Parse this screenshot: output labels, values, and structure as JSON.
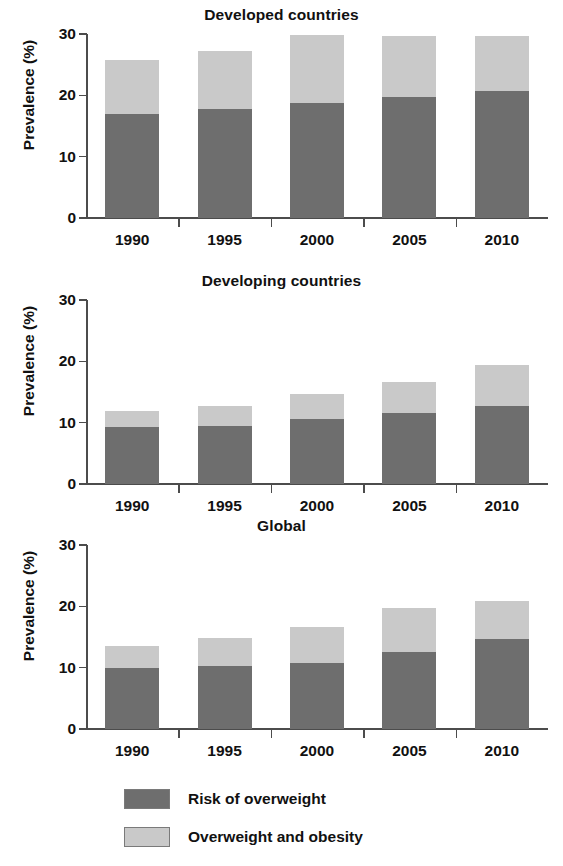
{
  "chart_data": {
    "type": "bar",
    "subtype": "stacked-bar",
    "title": "",
    "panels": [
      {
        "title": "Developed countries",
        "xlabel": "",
        "ylabel": "Prevalence (%)",
        "categories": [
          "1990",
          "1995",
          "2000",
          "2005",
          "2010"
        ],
        "ylim": [
          0,
          30
        ],
        "yticks": [
          0,
          10,
          20,
          30
        ],
        "ytick_labels": [
          "0",
          "10",
          "20",
          "30"
        ],
        "grid": false,
        "series": [
          {
            "name": "Risk of overweight",
            "values": [
              17.0,
              17.7,
              18.8,
              19.8,
              20.7
            ]
          },
          {
            "name": "Overweight and obesity",
            "values": [
              8.8,
              9.5,
              11.1,
              9.9,
              9.0
            ]
          }
        ],
        "totals": [
          25.8,
          27.2,
          29.9,
          29.7,
          29.7
        ]
      },
      {
        "title": "Developing countries",
        "xlabel": "",
        "ylabel": "Prevalence (%)",
        "categories": [
          "1990",
          "1995",
          "2000",
          "2005",
          "2010"
        ],
        "ylim": [
          0,
          30
        ],
        "yticks": [
          0,
          10,
          20,
          30
        ],
        "ytick_labels": [
          "0",
          "10",
          "20",
          "30"
        ],
        "grid": false,
        "series": [
          {
            "name": "Risk of overweight",
            "values": [
              9.3,
              9.5,
              10.6,
              11.6,
              12.7
            ]
          },
          {
            "name": "Overweight and obesity",
            "values": [
              2.6,
              3.2,
              4.0,
              5.1,
              6.7
            ]
          }
        ],
        "totals": [
          11.9,
          12.7,
          14.6,
          16.7,
          19.4
        ]
      },
      {
        "title": "Global",
        "xlabel": "",
        "ylabel": "Prevalence (%)",
        "categories": [
          "1990",
          "1995",
          "2000",
          "2005",
          "2010"
        ],
        "ylim": [
          0,
          30
        ],
        "yticks": [
          0,
          10,
          20,
          30
        ],
        "ytick_labels": [
          "0",
          "10",
          "20",
          "30"
        ],
        "grid": false,
        "series": [
          {
            "name": "Risk of overweight",
            "values": [
              9.9,
              10.2,
              10.8,
              12.6,
              14.7
            ]
          },
          {
            "name": "Overweight and obesity",
            "values": [
              3.7,
              4.7,
              5.9,
              7.2,
              6.1
            ]
          }
        ],
        "totals": [
          13.6,
          14.9,
          16.7,
          19.8,
          20.8
        ]
      }
    ],
    "legend": {
      "position": "bottom",
      "entries": [
        {
          "label": "Risk of overweight",
          "color": "#6e6e6e"
        },
        {
          "label": "Overweight and obesity",
          "color": "#c9c9c9"
        }
      ]
    },
    "colors": {
      "risk_of_overweight": "#6e6e6e",
      "overweight_and_obesity": "#c9c9c9",
      "axis": "#4c4c4c",
      "text": "#111111",
      "background": "#ffffff"
    }
  }
}
